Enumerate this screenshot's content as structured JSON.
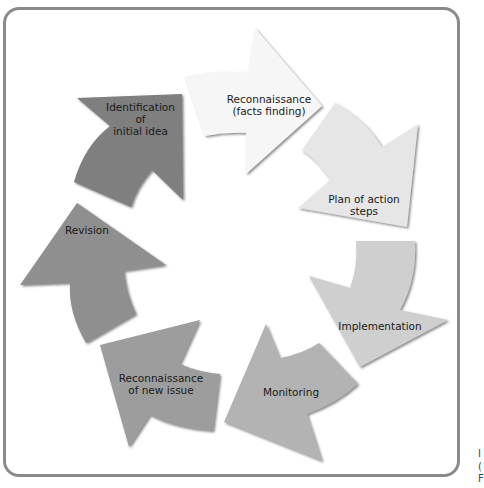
{
  "diagram": {
    "type": "cycle",
    "direction": "clockwise",
    "steps": [
      {
        "id": 1,
        "label": "Identification\nof\ninitial idea",
        "color": "#7f7f7f"
      },
      {
        "id": 2,
        "label": "Reconnaissance\n(facts finding)",
        "color": "#f4f4f4"
      },
      {
        "id": 3,
        "label": "Plan of action\nsteps",
        "color": "#e4e4e4"
      },
      {
        "id": 4,
        "label": "Implementation",
        "color": "#cdcdcd"
      },
      {
        "id": 5,
        "label": "Monitoring",
        "color": "#b0b0b0"
      },
      {
        "id": 6,
        "label": "Reconnaissance\nof new issue",
        "color": "#9c9c9c"
      },
      {
        "id": 7,
        "label": "Revision",
        "color": "#8e8e8e"
      }
    ],
    "frame_color": "#8a8a8a",
    "edge_marks": [
      "I",
      "(",
      "F"
    ]
  }
}
